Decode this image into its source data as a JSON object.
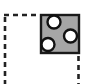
{
  "icon": {
    "name": "fill-pattern-area-icon",
    "description": "Dashed selection area with a gray patterned fill swatch containing three white circles",
    "colors": {
      "background": "#ffffff",
      "dash_stroke": "#222222",
      "swatch_fill": "#a6a6a6",
      "swatch_stroke": "#1a1a1a",
      "circle_fill": "#ffffff",
      "circle_stroke": "#111111"
    }
  }
}
